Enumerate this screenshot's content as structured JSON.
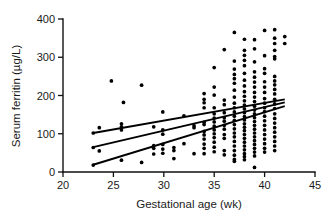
{
  "chart_data": {
    "type": "scatter",
    "title": "",
    "xlabel": "Gestational age (wk)",
    "ylabel": "Serum ferritin (µg/L)",
    "xlim": [
      20,
      45
    ],
    "ylim": [
      0,
      400
    ],
    "xticks": [
      20,
      25,
      30,
      35,
      40,
      45
    ],
    "yticks": [
      0,
      100,
      200,
      300,
      400
    ],
    "xtick_labels": [
      "20",
      "25",
      "30",
      "35",
      "40",
      "45"
    ],
    "ytick_labels": [
      "0",
      "100",
      "200",
      "300",
      "400"
    ],
    "grid": false,
    "legend": null,
    "marker": "filled-circle",
    "marker_color": "#000000",
    "points": [
      [
        23,
        18
      ],
      [
        23,
        64
      ],
      [
        23,
        102
      ],
      [
        23.6,
        55
      ],
      [
        23.6,
        116
      ],
      [
        24.8,
        238
      ],
      [
        25.8,
        110
      ],
      [
        25.8,
        118
      ],
      [
        25.8,
        126
      ],
      [
        25.8,
        31
      ],
      [
        26,
        182
      ],
      [
        27.8,
        227
      ],
      [
        27.8,
        25
      ],
      [
        29,
        118
      ],
      [
        29,
        69
      ],
      [
        29,
        62
      ],
      [
        29,
        47
      ],
      [
        29.9,
        157
      ],
      [
        29.9,
        110
      ],
      [
        29.9,
        99
      ],
      [
        29.9,
        72
      ],
      [
        29.9,
        60
      ],
      [
        29.9,
        49
      ],
      [
        31,
        64
      ],
      [
        31,
        56
      ],
      [
        31,
        35
      ],
      [
        32,
        147
      ],
      [
        32,
        74
      ],
      [
        33,
        121
      ],
      [
        33,
        116
      ],
      [
        33,
        48
      ],
      [
        34,
        205
      ],
      [
        34,
        190
      ],
      [
        34,
        181
      ],
      [
        34,
        168
      ],
      [
        34,
        130
      ],
      [
        34,
        124
      ],
      [
        34,
        106
      ],
      [
        34,
        97
      ],
      [
        34,
        86
      ],
      [
        34,
        73
      ],
      [
        34,
        62
      ],
      [
        34,
        48
      ],
      [
        35,
        273
      ],
      [
        35,
        222
      ],
      [
        35,
        201
      ],
      [
        35,
        168
      ],
      [
        35,
        152
      ],
      [
        35,
        141
      ],
      [
        35,
        131
      ],
      [
        35,
        120
      ],
      [
        35,
        110
      ],
      [
        35,
        100
      ],
      [
        35,
        90
      ],
      [
        35,
        78
      ],
      [
        35,
        65
      ],
      [
        35,
        53
      ],
      [
        36,
        320
      ],
      [
        36,
        188
      ],
      [
        36,
        176
      ],
      [
        36,
        155
      ],
      [
        36,
        142
      ],
      [
        36,
        133
      ],
      [
        36,
        122
      ],
      [
        36,
        112
      ],
      [
        36,
        98
      ],
      [
        36,
        88
      ],
      [
        36,
        56
      ],
      [
        36,
        45
      ],
      [
        37,
        365
      ],
      [
        37,
        290
      ],
      [
        37,
        269
      ],
      [
        37,
        255
      ],
      [
        37,
        244
      ],
      [
        37,
        232
      ],
      [
        37,
        214
      ],
      [
        37,
        196
      ],
      [
        37,
        180
      ],
      [
        37,
        168
      ],
      [
        37,
        157
      ],
      [
        37,
        146
      ],
      [
        37,
        135
      ],
      [
        37,
        124
      ],
      [
        37,
        113
      ],
      [
        37,
        102
      ],
      [
        37,
        92
      ],
      [
        37,
        80
      ],
      [
        37,
        68
      ],
      [
        37,
        56
      ],
      [
        37,
        44
      ],
      [
        37,
        33
      ],
      [
        37,
        28
      ],
      [
        38,
        347
      ],
      [
        38,
        318
      ],
      [
        38,
        305
      ],
      [
        38,
        292
      ],
      [
        38,
        278
      ],
      [
        38,
        258
      ],
      [
        38,
        240
      ],
      [
        38,
        225
      ],
      [
        38,
        210
      ],
      [
        38,
        198
      ],
      [
        38,
        186
      ],
      [
        38,
        175
      ],
      [
        38,
        165
      ],
      [
        38,
        155
      ],
      [
        38,
        145
      ],
      [
        38,
        136
      ],
      [
        38,
        126
      ],
      [
        38,
        117
      ],
      [
        38,
        108
      ],
      [
        38,
        98
      ],
      [
        38,
        88
      ],
      [
        38,
        78
      ],
      [
        38,
        68
      ],
      [
        38,
        58
      ],
      [
        38,
        48
      ],
      [
        38,
        40
      ],
      [
        38,
        32
      ],
      [
        39,
        346
      ],
      [
        39,
        322
      ],
      [
        39,
        288
      ],
      [
        39,
        262
      ],
      [
        39,
        248
      ],
      [
        39,
        235
      ],
      [
        39,
        222
      ],
      [
        39,
        208
      ],
      [
        39,
        196
      ],
      [
        39,
        184
      ],
      [
        39,
        172
      ],
      [
        39,
        162
      ],
      [
        39,
        152
      ],
      [
        39,
        142
      ],
      [
        39,
        132
      ],
      [
        39,
        122
      ],
      [
        39,
        112
      ],
      [
        39,
        102
      ],
      [
        39,
        92
      ],
      [
        39,
        82
      ],
      [
        39,
        72
      ],
      [
        39,
        62
      ],
      [
        39,
        52
      ],
      [
        39,
        42
      ],
      [
        39,
        12
      ],
      [
        40,
        370
      ],
      [
        40,
        304
      ],
      [
        40,
        270
      ],
      [
        40,
        258
      ],
      [
        40,
        236
      ],
      [
        40,
        222
      ],
      [
        40,
        208
      ],
      [
        40,
        192
      ],
      [
        40,
        180
      ],
      [
        40,
        168
      ],
      [
        40,
        158
      ],
      [
        40,
        146
      ],
      [
        40,
        134
      ],
      [
        40,
        122
      ],
      [
        40,
        110
      ],
      [
        40,
        98
      ],
      [
        40,
        86
      ],
      [
        40,
        74
      ],
      [
        40,
        62
      ],
      [
        40,
        52
      ],
      [
        41,
        372
      ],
      [
        41,
        350
      ],
      [
        41,
        336
      ],
      [
        41,
        318
      ],
      [
        41,
        302
      ],
      [
        41,
        296
      ],
      [
        41,
        250
      ],
      [
        41,
        238
      ],
      [
        41,
        228
      ],
      [
        41,
        216
      ],
      [
        41,
        204
      ],
      [
        41,
        190
      ],
      [
        41,
        178
      ],
      [
        41,
        166
      ],
      [
        41,
        152
      ],
      [
        41,
        140
      ],
      [
        41,
        128
      ],
      [
        41,
        116
      ],
      [
        41,
        104
      ],
      [
        41,
        92
      ],
      [
        41,
        80
      ],
      [
        41,
        68
      ],
      [
        41,
        56
      ],
      [
        42,
        354
      ],
      [
        42,
        336
      ]
    ],
    "fit_lines": [
      {
        "name": "regression-line",
        "x": [
          23,
          42
        ],
        "y": [
          65,
          182
        ]
      },
      {
        "name": "upper-confidence-band",
        "x": [
          23,
          42
        ],
        "y": [
          102,
          190
        ]
      },
      {
        "name": "lower-confidence-band",
        "x": [
          23,
          42
        ],
        "y": [
          19,
          172
        ]
      }
    ]
  }
}
